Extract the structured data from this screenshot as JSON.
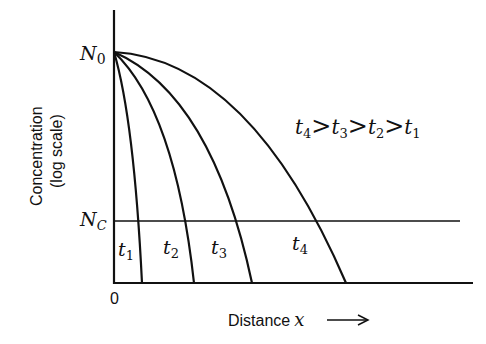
{
  "diagram": {
    "y_axis": {
      "label_line1": "Concentration",
      "label_line2": "(log scale)",
      "tick_top": "N",
      "tick_top_sub": "0",
      "tick_mid": "N",
      "tick_mid_sub": "C"
    },
    "x_axis": {
      "origin": "0",
      "label": "Distance",
      "label_var": "x",
      "arrow": "⟶"
    },
    "relation": {
      "t4": "t",
      "t4_sub": "4",
      "t3": "t",
      "t3_sub": "3",
      "t2": "t",
      "t2_sub": "2",
      "t1": "t",
      "t1_sub": "1",
      "gt": ">"
    },
    "curves": [
      {
        "name": "t",
        "sub": "1",
        "end_x": 142
      },
      {
        "name": "t",
        "sub": "2",
        "end_x": 194
      },
      {
        "name": "t",
        "sub": "3",
        "end_x": 252
      },
      {
        "name": "t",
        "sub": "4",
        "end_x": 346
      }
    ],
    "colors": {
      "line": "#111111",
      "background": "#ffffff"
    }
  }
}
